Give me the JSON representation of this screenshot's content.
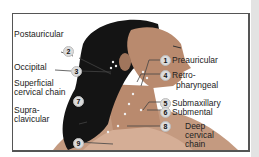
{
  "diagram": {
    "colors": {
      "hair": "#141414",
      "skin": "#b98a6e",
      "skin_shadow": "#8d6450",
      "leader": "#444444",
      "badge": "#dcdcdc"
    },
    "labels": [
      {
        "num": "1",
        "text": "Preauricular"
      },
      {
        "num": "2",
        "text": "Postauricular"
      },
      {
        "num": "3",
        "text": "Occipital"
      },
      {
        "num": "4",
        "text": "Retro-\npharyngeal",
        "line1": "Retro-",
        "line2": "pharyngeal"
      },
      {
        "num": "5",
        "text": "Submaxillary"
      },
      {
        "num": "6",
        "text": "Submental"
      },
      {
        "num": "7",
        "text": "Superficial cervical chain",
        "line1": "Superficial",
        "line2": "cervical chain"
      },
      {
        "num": "8",
        "text": "Deep cervical chain",
        "line1": "Deep",
        "line2": "cervical",
        "line3": "chain"
      },
      {
        "num": "9",
        "text": "Supra-clavicular",
        "line1": "Supra-",
        "line2": "clavicular"
      }
    ]
  }
}
